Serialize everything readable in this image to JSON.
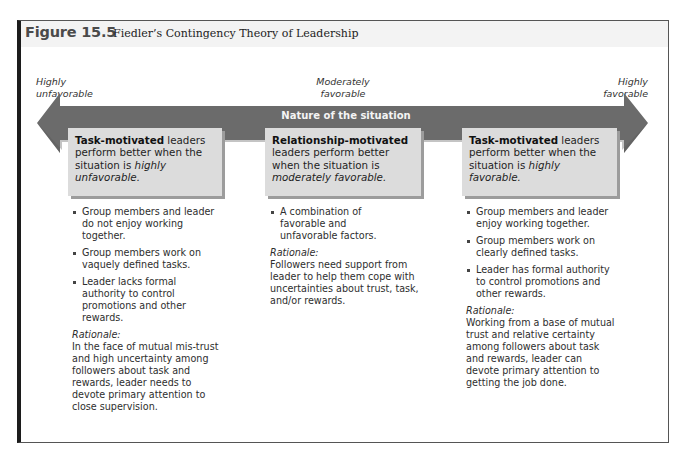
{
  "figure": {
    "number": "Figure 15.5",
    "title": "Fiedler’s Contingency Theory of Leadership"
  },
  "scale": {
    "left": [
      "Highly",
      "unfavorable"
    ],
    "middle": [
      "Moderately",
      "favorable"
    ],
    "right": [
      "Highly",
      "favorable"
    ],
    "arrow_label": "Nature of the situation"
  },
  "colors": {
    "arrow": "#6b6b6b",
    "box": "#dcdcdc",
    "box_shadow": "#9c9c9c",
    "frame": "#1c1c1c"
  },
  "columns": [
    {
      "box": {
        "bold": "Task-motivated",
        "text1": " leaders perform better when the situation is ",
        "italic": "highly unfavorable."
      },
      "bullets": [
        "Group members and leader do not enjoy working together.",
        "Group members work on vaquely defined tasks.",
        "Leader lacks formal authority to control promotions and other rewards."
      ],
      "rationale_label": "Rationale:",
      "rationale": "In the face of mutual mis-trust and high uncertainty among followers about task and rewards, leader needs to devote primary attention to close supervision."
    },
    {
      "box": {
        "bold": "Relationship-motivated",
        "text1": " leaders perform better when the situation is ",
        "italic": "moderately favorable."
      },
      "bullets": [
        "A combination of favorable and unfavorable factors."
      ],
      "rationale_label": "Rationale:",
      "rationale": "Followers need support from leader to help them cope with uncertainties about trust, task, and/or rewards."
    },
    {
      "box": {
        "bold": "Task-motivated",
        "text1": " leaders perform better when the situation is ",
        "italic": "highly favorable."
      },
      "bullets": [
        "Group members and leader enjoy working together.",
        "Group members work on clearly defined tasks.",
        "Leader has formal authority to control promotions and other rewards."
      ],
      "rationale_label": "Rationale:",
      "rationale": "Working from a base of mutual trust and relative certainty among followers about task and rewards, leader can devote primary attention to getting the job done."
    }
  ]
}
